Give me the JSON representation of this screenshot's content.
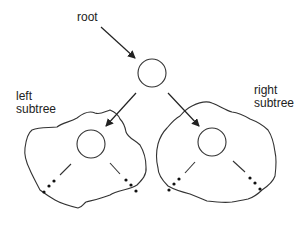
{
  "diagram": {
    "type": "binary-tree-recursive-structure",
    "labels": {
      "root": "root",
      "left_subtree_line1": "left",
      "left_subtree_line2": "subtree",
      "right_subtree_line1": "right",
      "right_subtree_line2": "subtree"
    },
    "nodes": [
      {
        "id": "root",
        "label": "root node"
      },
      {
        "id": "left-child",
        "label": "left subtree root"
      },
      {
        "id": "right-child",
        "label": "right subtree root"
      }
    ],
    "edges": [
      {
        "from": "root-label",
        "to": "root"
      },
      {
        "from": "root",
        "to": "left-child"
      },
      {
        "from": "root",
        "to": "right-child"
      }
    ],
    "stroke_color": "#333333",
    "background": "#ffffff"
  }
}
